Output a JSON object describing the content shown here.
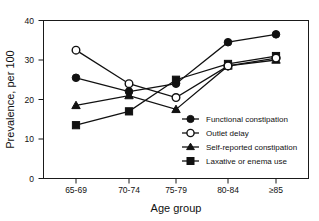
{
  "chart_data": {
    "type": "line",
    "title": "",
    "xlabel": "Age group",
    "ylabel": "Prevalence, per 100",
    "categories": [
      "65-69",
      "70-74",
      "75-79",
      "80-84",
      "≥85"
    ],
    "ylim": [
      0,
      40
    ],
    "yticks": [
      0,
      10,
      20,
      30,
      40
    ],
    "grid": false,
    "legend_position": "center-right-inside",
    "series": [
      {
        "name": "Functional constipation",
        "marker": "filled-circle",
        "values": [
          25.5,
          22.0,
          24.0,
          34.5,
          36.5
        ]
      },
      {
        "name": "Outlet delay",
        "marker": "open-circle",
        "values": [
          32.5,
          24.0,
          20.5,
          28.5,
          30.5
        ]
      },
      {
        "name": "Self-reported constipation",
        "marker": "filled-triangle",
        "values": [
          18.5,
          21.0,
          17.5,
          28.5,
          30.0
        ]
      },
      {
        "name": "Laxative or enema use",
        "marker": "filled-square",
        "values": [
          13.5,
          17.0,
          25.0,
          29.0,
          31.0
        ]
      }
    ]
  },
  "axes": {
    "y_tick_labels": [
      "0",
      "10",
      "20",
      "30",
      "40"
    ],
    "x_tick_labels": [
      "65-69",
      "70-74",
      "75-79",
      "80-84",
      "≥85"
    ],
    "y_axis_title": "Prevalence, per 100",
    "x_axis_title": "Age group"
  },
  "legend": {
    "items": [
      {
        "label": "Functional constipation",
        "marker": "filled-circle"
      },
      {
        "label": "Outlet delay",
        "marker": "open-circle"
      },
      {
        "label": "Self-reported constipation",
        "marker": "filled-triangle"
      },
      {
        "label": "Laxative or enema use",
        "marker": "filled-square"
      }
    ]
  },
  "colors": {
    "ink": "#111111",
    "background": "#ffffff"
  }
}
